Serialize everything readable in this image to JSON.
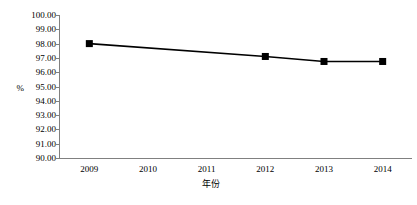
{
  "chart_data": {
    "type": "line",
    "title": "",
    "subtitle": "",
    "xlabel": "年份",
    "ylabel": "%",
    "categories": [
      "2009",
      "2010",
      "2011",
      "2012",
      "2013",
      "2014"
    ],
    "series": [
      {
        "name": "",
        "x": [
          "2009",
          "2012",
          "2013",
          "2014"
        ],
        "values": [
          98.0,
          97.1,
          96.75,
          96.75
        ]
      }
    ],
    "points": [
      {
        "x": "2009",
        "y": 98.0
      },
      {
        "x": "2012",
        "y": 97.1
      },
      {
        "x": "2013",
        "y": 96.75
      },
      {
        "x": "2014",
        "y": 96.75
      }
    ],
    "ylim": [
      90.0,
      100.0
    ],
    "ytick_step": 1.0,
    "ytick_labels": [
      "100.00",
      "99.00",
      "98.00",
      "97.00",
      "96.00",
      "95.00",
      "94.00",
      "93.00",
      "92.00",
      "91.00",
      "90.00"
    ],
    "ytick_values": [
      100,
      99,
      98,
      97,
      96,
      95,
      94,
      93,
      92,
      91,
      90
    ],
    "xtick_labels": [
      "2009",
      "2010",
      "2011",
      "2012",
      "2013",
      "2014"
    ],
    "grid": false,
    "legend": false,
    "legend_position": "none",
    "marker": "filled-square",
    "colors": {
      "line": "#000000",
      "marker": "#000000",
      "axis": "#808080",
      "text": "#000000",
      "background": "#ffffff"
    }
  }
}
